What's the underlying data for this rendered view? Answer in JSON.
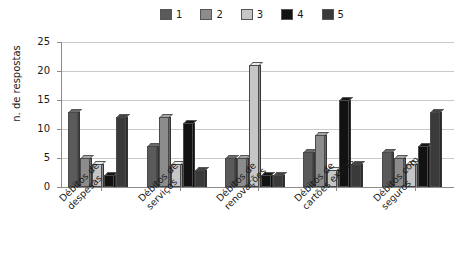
{
  "chart_data": {
    "type": "bar",
    "title": "",
    "subtitle": "",
    "xlabel": "",
    "ylabel": "n. de respostas",
    "ylim": [
      0,
      25
    ],
    "yticks": [
      0,
      5,
      10,
      15,
      20,
      25
    ],
    "grid": true,
    "legend_position": "top",
    "orientation": "vertical",
    "grouping": "grouped",
    "categories": [
      "Débitos de despesas",
      "Débitos de serviços",
      "Débitos de renovações",
      "Débitos de cartões extras",
      "Débitos com seguros"
    ],
    "series": [
      {
        "name": "1",
        "color": "#5a5a5a",
        "values": [
          13,
          7,
          5,
          6,
          6
        ]
      },
      {
        "name": "2",
        "color": "#8c8c8c",
        "values": [
          5,
          12,
          5,
          9,
          5
        ]
      },
      {
        "name": "3",
        "color": "#c6c6c6",
        "values": [
          4,
          4,
          21,
          3,
          4
        ]
      },
      {
        "name": "4",
        "color": "#121212",
        "values": [
          2,
          11,
          2,
          15,
          7
        ]
      },
      {
        "name": "5",
        "color": "#3a3a3a",
        "values": [
          12,
          3,
          2,
          4,
          13
        ]
      }
    ]
  },
  "legend": {
    "items": [
      {
        "label": "1",
        "color": "#5a5a5a"
      },
      {
        "label": "2",
        "color": "#8c8c8c"
      },
      {
        "label": "3",
        "color": "#c6c6c6"
      },
      {
        "label": "4",
        "color": "#121212"
      },
      {
        "label": "5",
        "color": "#3a3a3a"
      }
    ]
  },
  "axes": {
    "y_title": "n. de respostas",
    "y_tick_labels": [
      "0",
      "5",
      "10",
      "15",
      "20",
      "25"
    ],
    "x_tick_labels": [
      "Débitos de despesas",
      "Débitos de serviços",
      "Débitos de renovações",
      "Débitos de cartões extras",
      "Débitos com seguros"
    ]
  }
}
